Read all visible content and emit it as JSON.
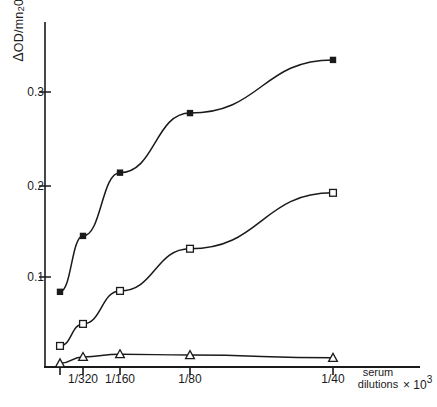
{
  "chart_data": {
    "type": "line",
    "title": "",
    "ylabel": "Δ OD/mn 20",
    "ylabel_parts": {
      "delta": "Δ",
      "od": "OD",
      "slash": "/mn",
      "sub": "2",
      "tail": "0"
    },
    "xlabel": "serum dilutions ×10³",
    "xlabel_line1": "serum",
    "xlabel_line2": "dilutions",
    "xlabel_multiplier": "× 10",
    "xlabel_exponent": "3",
    "x_tick_labels": [
      "",
      "1/320",
      "1/160",
      "1/80",
      "1/40"
    ],
    "x_tick_values": [
      1,
      2,
      3,
      4,
      5
    ],
    "y_tick_labels": [
      "0.1",
      "0.2",
      "0.3"
    ],
    "y_tick_values": [
      0.1,
      0.2,
      0.3
    ],
    "ylim": [
      0,
      0.36
    ],
    "grid": false,
    "legend": "none",
    "axis_color": "#1a1a1a",
    "series": [
      {
        "name": "filled-square-series",
        "marker": "filled-square",
        "color": "#1a1a1a",
        "x": [
          1,
          2,
          3,
          4,
          5
        ],
        "values": [
          0.082,
          0.143,
          0.212,
          0.277,
          0.335
        ]
      },
      {
        "name": "open-square-series",
        "marker": "open-square",
        "color": "#1a1a1a",
        "x": [
          1,
          2,
          3,
          4,
          5
        ],
        "values": [
          0.023,
          0.047,
          0.083,
          0.129,
          0.19
        ]
      },
      {
        "name": "open-triangle-series",
        "marker": "open-triangle",
        "color": "#1a1a1a",
        "x": [
          1,
          2,
          3,
          4,
          5
        ],
        "values": [
          0.004,
          0.011,
          0.014,
          0.013,
          0.01
        ]
      }
    ]
  }
}
